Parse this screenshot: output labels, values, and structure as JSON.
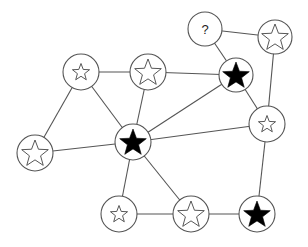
{
  "diagram": {
    "type": "graph",
    "colors": {
      "edge": "#555555",
      "node_stroke": "#555555",
      "filled_star": "#000000",
      "background": "#ffffff"
    },
    "nodes": [
      {
        "id": "n1",
        "x": 81,
        "y": 72,
        "r": 18,
        "symbol": "star-outline",
        "star_size": "small"
      },
      {
        "id": "n2",
        "x": 148,
        "y": 72,
        "r": 18,
        "symbol": "star-outline",
        "star_size": "large"
      },
      {
        "id": "n3",
        "x": 205,
        "y": 29,
        "r": 17,
        "symbol": "question",
        "label": "?"
      },
      {
        "id": "n4",
        "x": 275,
        "y": 37,
        "r": 17,
        "symbol": "star-outline",
        "star_size": "large"
      },
      {
        "id": "n5",
        "x": 236,
        "y": 75,
        "r": 17,
        "symbol": "star-filled",
        "star_size": "large"
      },
      {
        "id": "n6",
        "x": 267,
        "y": 124,
        "r": 18,
        "symbol": "star-outline",
        "star_size": "small"
      },
      {
        "id": "n7",
        "x": 133,
        "y": 142,
        "r": 18,
        "symbol": "star-filled",
        "star_size": "large"
      },
      {
        "id": "n8",
        "x": 35,
        "y": 153,
        "r": 18,
        "symbol": "star-outline",
        "star_size": "large"
      },
      {
        "id": "n9",
        "x": 119,
        "y": 214,
        "r": 18,
        "symbol": "star-outline",
        "star_size": "small"
      },
      {
        "id": "n10",
        "x": 191,
        "y": 214,
        "r": 18,
        "symbol": "star-outline",
        "star_size": "large"
      },
      {
        "id": "n11",
        "x": 257,
        "y": 214,
        "r": 18,
        "symbol": "star-filled",
        "star_size": "large"
      }
    ],
    "edges": [
      [
        "n1",
        "n2"
      ],
      [
        "n1",
        "n8"
      ],
      [
        "n1",
        "n7"
      ],
      [
        "n2",
        "n5"
      ],
      [
        "n2",
        "n7"
      ],
      [
        "n3",
        "n4"
      ],
      [
        "n3",
        "n5"
      ],
      [
        "n4",
        "n6"
      ],
      [
        "n5",
        "n7"
      ],
      [
        "n5",
        "n6"
      ],
      [
        "n6",
        "n7"
      ],
      [
        "n6",
        "n11"
      ],
      [
        "n7",
        "n8"
      ],
      [
        "n7",
        "n9"
      ],
      [
        "n7",
        "n10"
      ],
      [
        "n9",
        "n10"
      ],
      [
        "n10",
        "n11"
      ]
    ]
  }
}
